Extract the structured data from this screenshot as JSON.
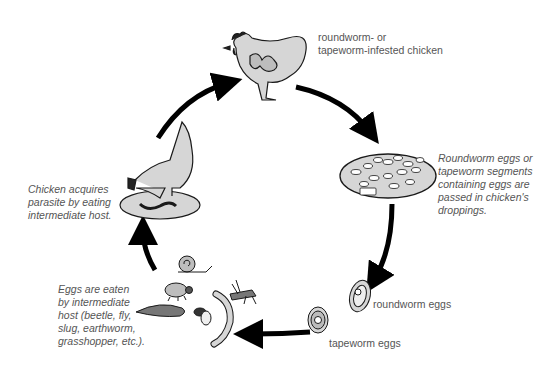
{
  "diagram": {
    "type": "life-cycle",
    "stages": [
      {
        "id": "infested-chicken",
        "label_lines": [
          "roundworm- or",
          "tapeworm-infested chicken"
        ]
      },
      {
        "id": "droppings",
        "label_lines": [
          "Roundworm eggs or",
          "tapeworm segments",
          "containing eggs are",
          "passed in chicken's",
          "droppings."
        ]
      },
      {
        "id": "eggs",
        "labels": {
          "roundworm": "roundworm eggs",
          "tapeworm": "tapeworm eggs"
        }
      },
      {
        "id": "intermediate-host",
        "label_lines": [
          "Eggs are eaten",
          "by intermediate",
          "host (beetle, fly,",
          "slug, earthworm,",
          "grasshopper, etc.)."
        ]
      },
      {
        "id": "chicken-eating",
        "label_lines": [
          "Chicken acquires",
          "parasite by eating",
          "intermediate host."
        ]
      }
    ],
    "arrows": [
      {
        "from": "chicken-eating",
        "to": "infested-chicken"
      },
      {
        "from": "infested-chicken",
        "to": "droppings"
      },
      {
        "from": "droppings",
        "to": "eggs"
      },
      {
        "from": "eggs",
        "to": "intermediate-host"
      },
      {
        "from": "intermediate-host",
        "to": "chicken-eating"
      }
    ],
    "colors": {
      "fill": "#d6d6d6",
      "stroke": "#1a1a1a",
      "text": "#555555",
      "arrow": "#000000"
    }
  }
}
